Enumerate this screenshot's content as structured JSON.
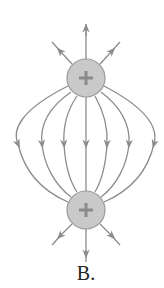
{
  "figure": {
    "label": "B.",
    "colors": {
      "line": "#8c8c8c",
      "charge_fill": "#c9c9c9",
      "charge_stroke": "#9a9a9a",
      "sign": "#8a8a8a"
    },
    "charges": [
      {
        "id": "top",
        "sign": "+",
        "cx": 86,
        "cy": 78,
        "r": 19
      },
      {
        "id": "bottom",
        "sign": "+",
        "cx": 86,
        "cy": 210,
        "r": 19
      }
    ],
    "field_line_count": 7,
    "outward_arrows_per_charge": 3
  }
}
